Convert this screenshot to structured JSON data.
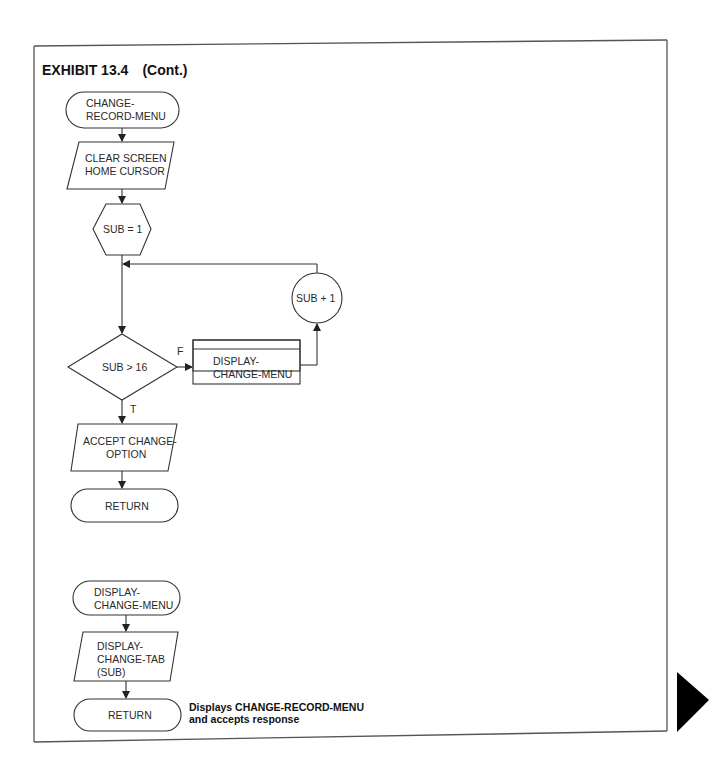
{
  "title": "EXHIBIT 13.4",
  "subtitle": "(Cont.)",
  "flowchart1": {
    "start": [
      "CHANGE-",
      "RECORD-MENU"
    ],
    "io1": [
      "CLEAR SCREEN",
      "HOME CURSOR"
    ],
    "prep": "SUB = 1",
    "decision": "SUB > 16",
    "false_label": "F",
    "true_label": "T",
    "process": [
      "DISPLAY-",
      "CHANGE-MENU"
    ],
    "increment": "SUB + 1",
    "io2": [
      "ACCEPT CHANGE-",
      "OPTION"
    ],
    "end": "RETURN"
  },
  "flowchart2": {
    "start": [
      "DISPLAY-",
      "CHANGE-MENU"
    ],
    "io1": [
      "DISPLAY-",
      "CHANGE-TAB",
      "(SUB)"
    ],
    "end": "RETURN"
  },
  "caption": [
    "Displays CHANGE-RECORD-MENU",
    "and accepts response"
  ],
  "colors": {
    "ink": "#333333",
    "marker": "#000000",
    "background": "#ffffff"
  }
}
